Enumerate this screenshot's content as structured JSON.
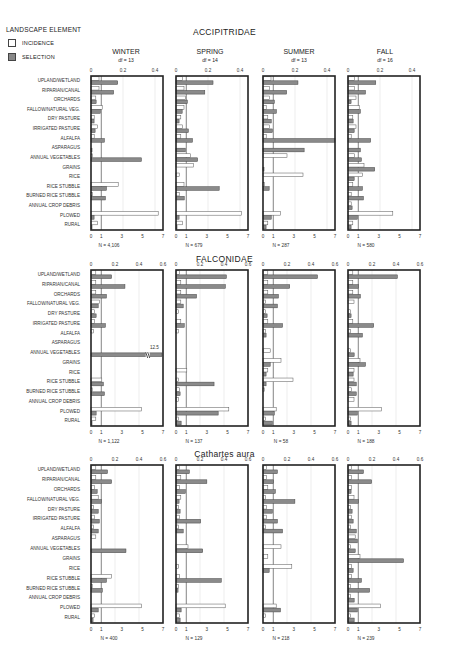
{
  "legend": {
    "title": "LANDSCAPE ELEMENT",
    "items": [
      {
        "label": "INCIDENCE",
        "style": "open"
      },
      {
        "label": "SELECTION",
        "style": "shaded"
      }
    ]
  },
  "colors": {
    "selection_fill": "#8a8a8a",
    "incidence_fill": "#ffffff",
    "frame": "#222222"
  },
  "chart_data": {
    "type": "bar",
    "orientation": "horizontal",
    "categories": [
      "UPLAND/WETLAND",
      "RIPARIAN/CANAL",
      "ORCHARDS",
      "FALLOW/NATURAL VEG.",
      "DRY PASTURE",
      "IRRIGATED PASTURE",
      "ALFALFA",
      "ASPARAGUS",
      "ANNUAL VEGETABLES",
      "GRAINS",
      "RICE",
      "RICE STUBBLE",
      "BURNED RICE STUBBLE",
      "ANNUAL CROP DEBRIS",
      "PLOWED",
      "RURAL"
    ],
    "bottom_axis": {
      "label": "selection",
      "range": [
        0,
        7
      ],
      "ticks": [
        "0",
        "1",
        "3",
        "5",
        "7"
      ],
      "reference_line": 1
    },
    "seasons": [
      "WINTER",
      "SPRING",
      "SUMMER",
      "FALL"
    ],
    "families": [
      {
        "title": "ACCIPITRIDAE",
        "top_axis": {
          "label": "incidence",
          "range": [
            0,
            0.45
          ],
          "ticks": [
            "0",
            "0.2",
            "0.4"
          ]
        },
        "panels": [
          {
            "season": "WINTER",
            "df": "df = 13",
            "n": "N = 4,106",
            "incidence": [
              0.05,
              0.05,
              0.03,
              0.07,
              0.02,
              0.04,
              0.02,
              0.0,
              0.01,
              0.0,
              0.0,
              0.17,
              0.01,
              0.0,
              0.42,
              0.04
            ],
            "selection": [
              2.6,
              2.2,
              0.5,
              0.9,
              0.3,
              0.4,
              1.3,
              0.1,
              4.9,
              0.0,
              0.0,
              1.5,
              1.4,
              0.0,
              0.3,
              0.1
            ]
          },
          {
            "season": "SPRING",
            "df": "df = 14",
            "n": "N = 679",
            "incidence": [
              0.04,
              0.05,
              0.06,
              0.05,
              0.03,
              0.04,
              0.03,
              0.0,
              0.09,
              0.11,
              0.02,
              0.05,
              0.02,
              0.0,
              0.41,
              0.04
            ],
            "selection": [
              3.6,
              2.8,
              1.1,
              0.6,
              0.3,
              1.2,
              1.6,
              0.9,
              2.1,
              0.0,
              0.0,
              4.2,
              0.8,
              0.0,
              0.3,
              0.1
            ]
          },
          {
            "season": "SUMMER",
            "df": "df = 13",
            "n": "N = 287",
            "incidence": [
              0.05,
              0.04,
              0.04,
              0.02,
              0.03,
              0.04,
              0.02,
              0.0,
              0.15,
              0.0,
              0.25,
              0.01,
              0.0,
              0.0,
              0.11,
              0.03
            ],
            "selection": [
              3.4,
              2.3,
              1.1,
              1.3,
              0.8,
              0.9,
              7.0,
              4.0,
              0.0,
              0.1,
              0.0,
              0.6,
              0.0,
              0.0,
              0.8,
              0.3
            ]
          },
          {
            "season": "FALL",
            "df": "df = 16",
            "n": "N = 580",
            "incidence": [
              0.04,
              0.04,
              0.05,
              0.07,
              0.03,
              0.05,
              0.02,
              0.0,
              0.04,
              0.1,
              0.09,
              0.03,
              0.02,
              0.02,
              0.28,
              0.03
            ],
            "selection": [
              2.7,
              1.7,
              0.3,
              1.2,
              0.5,
              0.6,
              2.2,
              1.2,
              1.3,
              2.6,
              0.6,
              1.4,
              1.5,
              0.4,
              0.9,
              0.3
            ]
          }
        ]
      },
      {
        "title": "FALCONIDAE",
        "top_axis": {
          "label": "incidence",
          "range": [
            0,
            0.6
          ],
          "ticks": [
            "0",
            "0.2",
            "0.4",
            "0.6"
          ]
        },
        "panels": [
          {
            "season": "WINTER",
            "df": "",
            "n": "N = 1,122",
            "incidence": [
              0.04,
              0.04,
              0.04,
              0.07,
              0.03,
              0.03,
              0.02,
              0.0,
              0.0,
              0.0,
              0.0,
              0.09,
              0.01,
              0.0,
              0.42,
              0.04
            ],
            "selection": [
              2.0,
              3.3,
              1.5,
              0.7,
              0.5,
              1.4,
              0.0,
              0.0,
              12.5,
              0.0,
              0.0,
              1.2,
              1.3,
              0.0,
              0.5,
              0.1
            ],
            "annotations": [
              {
                "category": "ANNUAL VEGETABLES",
                "text": "12.5",
                "note": "axis break"
              }
            ]
          },
          {
            "season": "SPRING",
            "df": "",
            "n": "N = 137",
            "incidence": [
              0.03,
              0.04,
              0.04,
              0.04,
              0.02,
              0.04,
              0.02,
              0.0,
              0.0,
              0.0,
              0.09,
              0.02,
              0.03,
              0.02,
              0.44,
              0.02
            ],
            "selection": [
              4.9,
              4.8,
              2.0,
              0.7,
              0.0,
              0.8,
              0.0,
              0.0,
              0.0,
              0.0,
              0.0,
              3.7,
              0.4,
              0.0,
              4.1,
              0.5
            ]
          },
          {
            "season": "SUMMER",
            "df": "",
            "n": "N = 58",
            "incidence": [
              0.04,
              0.04,
              0.04,
              0.02,
              0.02,
              0.04,
              0.02,
              0.0,
              0.06,
              0.15,
              0.04,
              0.25,
              0.01,
              0.0,
              0.11,
              0.02
            ],
            "selection": [
              5.3,
              2.6,
              1.5,
              1.4,
              0.4,
              1.9,
              0.3,
              0.0,
              0.0,
              0.7,
              0.3,
              0.3,
              0.0,
              0.0,
              1.1,
              0.9
            ]
          },
          {
            "season": "FALL",
            "df": "",
            "n": "N = 188",
            "incidence": [
              0.04,
              0.04,
              0.04,
              0.05,
              0.02,
              0.04,
              0.02,
              0.0,
              0.02,
              0.1,
              0.05,
              0.05,
              0.03,
              0.05,
              0.28,
              0.02
            ],
            "selection": [
              4.8,
              1.0,
              1.2,
              0.0,
              0.3,
              2.5,
              1.4,
              0.0,
              0.6,
              1.7,
              0.5,
              0.8,
              0.8,
              0.0,
              0.9,
              0.3
            ]
          }
        ]
      },
      {
        "title": "Cathartes aura",
        "top_axis": {
          "label": "incidence",
          "range": [
            0,
            0.6
          ],
          "ticks": [
            "0",
            "0.2",
            "0.4",
            "0.6"
          ]
        },
        "panels": [
          {
            "season": "WINTER",
            "df": "",
            "n": "N = 400",
            "incidence": [
              0.04,
              0.04,
              0.03,
              0.06,
              0.02,
              0.03,
              0.02,
              0.04,
              0.0,
              0.0,
              0.0,
              0.17,
              0.01,
              0.0,
              0.42,
              0.03
            ],
            "selection": [
              1.6,
              2.0,
              0.6,
              1.0,
              0.7,
              0.8,
              0.7,
              0.0,
              3.4,
              0.0,
              0.0,
              1.5,
              1.1,
              0.0,
              0.7,
              0.2
            ]
          },
          {
            "season": "SPRING",
            "df": "",
            "n": "N = 129",
            "incidence": [
              0.03,
              0.04,
              0.03,
              0.04,
              0.02,
              0.03,
              0.02,
              0.0,
              0.1,
              0.0,
              0.02,
              0.03,
              0.02,
              0.0,
              0.41,
              0.03
            ],
            "selection": [
              1.3,
              3.0,
              0.9,
              0.3,
              0.4,
              2.4,
              0.7,
              0.0,
              2.6,
              0.0,
              0.0,
              4.4,
              0.2,
              0.0,
              0.5,
              0.4
            ]
          },
          {
            "season": "SUMMER",
            "df": "",
            "n": "N = 218",
            "incidence": [
              0.03,
              0.03,
              0.04,
              0.02,
              0.03,
              0.03,
              0.02,
              0.0,
              0.15,
              0.04,
              0.24,
              0.0,
              0.0,
              0.0,
              0.11,
              0.02
            ],
            "selection": [
              1.4,
              1.0,
              1.2,
              3.1,
              0.9,
              1.4,
              1.9,
              0.0,
              0.0,
              0.0,
              0.6,
              0.0,
              0.0,
              0.0,
              1.7,
              0.0
            ]
          },
          {
            "season": "FALL",
            "df": "",
            "n": "N = 239",
            "incidence": [
              0.03,
              0.03,
              0.03,
              0.05,
              0.02,
              0.03,
              0.02,
              0.06,
              0.02,
              0.1,
              0.03,
              0.03,
              0.02,
              0.02,
              0.27,
              0.02
            ],
            "selection": [
              1.5,
              2.3,
              0.3,
              1.0,
              0.4,
              0.5,
              0.8,
              0.9,
              0.7,
              5.4,
              0.5,
              1.3,
              2.1,
              0.6,
              0.9,
              0.6
            ]
          }
        ]
      }
    ]
  }
}
